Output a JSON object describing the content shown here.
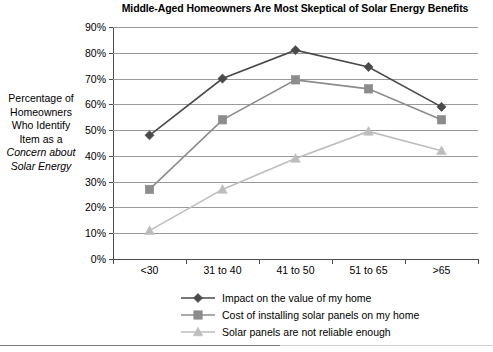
{
  "chart_data": {
    "type": "line",
    "title": "Middle-Aged Homeowners Are Most Skeptical of Solar Energy Benefits",
    "xlabel": "",
    "ylabel_lines": [
      "Percentage of",
      "Homeowners",
      "Who Identify",
      "Item as a",
      "Concern about",
      "Solar Energy"
    ],
    "ylabel_italic_from_line": 4,
    "categories": [
      "<30",
      "31 to 40",
      "41 to 50",
      "51 to 65",
      ">65"
    ],
    "ylim": [
      0,
      90
    ],
    "ytick_labels": [
      "0%",
      "10%",
      "20%",
      "30%",
      "40%",
      "50%",
      "60%",
      "70%",
      "80%",
      "90%"
    ],
    "ytick_values": [
      0,
      10,
      20,
      30,
      40,
      50,
      60,
      70,
      80,
      90
    ],
    "grid": true,
    "legend_position": "bottom",
    "series": [
      {
        "name": "Impact on the value of my home",
        "marker": "diamond",
        "color": "#4a4a4a",
        "values": [
          48,
          70,
          81,
          74.5,
          59
        ]
      },
      {
        "name": "Cost of installing solar panels on my home",
        "marker": "square",
        "color": "#8c8c8c",
        "values": [
          27,
          54,
          69.5,
          66,
          54
        ]
      },
      {
        "name": "Solar panels are not reliable enough",
        "marker": "triangle",
        "color": "#bdbdbd",
        "values": [
          11,
          27,
          39,
          49.5,
          42
        ]
      }
    ]
  },
  "colors": {
    "series_1": "#4a4a4a",
    "series_2": "#8c8c8c",
    "series_3": "#bdbdbd",
    "gridline": "#9a9a9a",
    "axis": "#4d4d4d",
    "background": "#ffffff"
  }
}
